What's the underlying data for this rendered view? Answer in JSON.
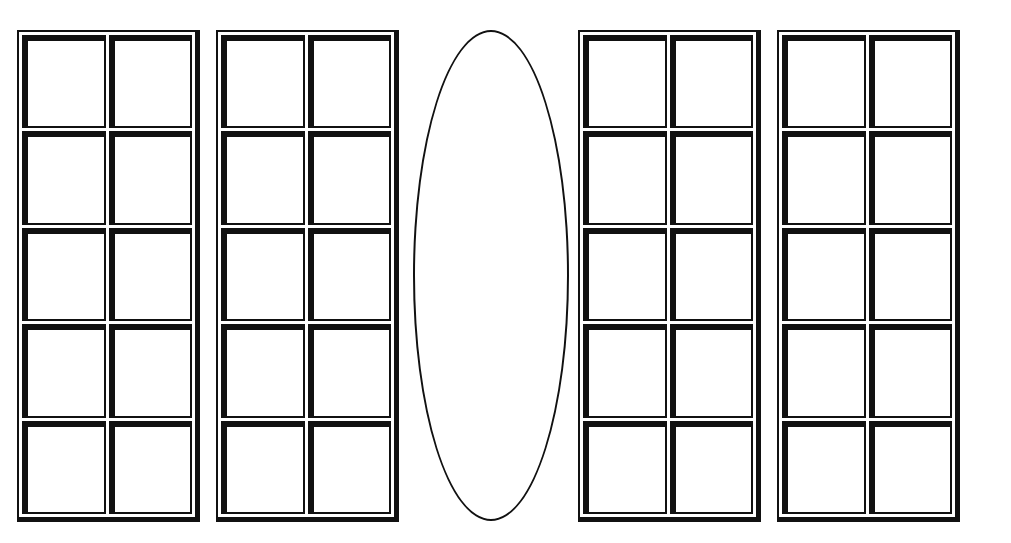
{
  "diagram": {
    "type": "ten-frames-with-oval",
    "layout_order": [
      "frame",
      "frame",
      "oval",
      "frame",
      "frame"
    ],
    "frames": [
      {
        "id": "frame-1",
        "rows": 5,
        "columns": 2,
        "filled_cells": 0
      },
      {
        "id": "frame-2",
        "rows": 5,
        "columns": 2,
        "filled_cells": 0
      },
      {
        "id": "frame-3",
        "rows": 5,
        "columns": 2,
        "filled_cells": 0
      },
      {
        "id": "frame-4",
        "rows": 5,
        "columns": 2,
        "filled_cells": 0
      }
    ],
    "oval": {
      "id": "oval",
      "contents": ""
    },
    "colors": {
      "line": "#111111",
      "background": "#ffffff"
    }
  }
}
